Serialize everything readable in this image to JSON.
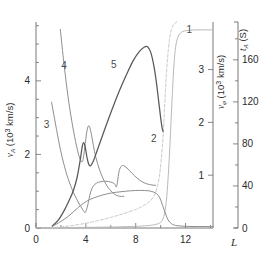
{
  "chart_data": {
    "type": "line",
    "title": "",
    "xlabel": "L",
    "ylabel": "v_A (10^3 km/s)",
    "ylabel_right_inner": "v_phi (10^3 km/s)",
    "ylabel_right_outer": "t_A (S)",
    "xlim": [
      0,
      14.2
    ],
    "ylim": [
      0,
      5.6
    ],
    "ylim_right_inner": [
      0,
      3.9
    ],
    "ylim_right_outer": [
      0,
      196
    ],
    "grid": false,
    "legend": "inline-curve-numbers",
    "xticks": [
      0,
      4,
      8,
      12
    ],
    "xticklabels": [
      "0",
      "4",
      "8",
      "12"
    ],
    "xminorticks": [
      2,
      6,
      10,
      14
    ],
    "yticks_left": [
      0,
      2,
      4
    ],
    "yticklabels_left": [
      "0",
      "2",
      "4"
    ],
    "yminorticks_left": [
      0.5,
      1,
      1.5,
      2.5,
      3,
      3.5,
      4.5,
      5,
      5.5
    ],
    "yticks_right_inner": [
      1,
      2,
      3
    ],
    "yticklabels_right_inner": [
      "1",
      "2",
      "3"
    ],
    "yticks_right_outer": [
      0,
      40,
      80,
      120,
      160
    ],
    "yticklabels_right_outer": [
      "0",
      "40",
      "80",
      "120",
      "160"
    ],
    "yminorticks_right_outer": [
      20,
      60,
      100,
      140,
      180
    ],
    "series": [
      {
        "name": "1",
        "label": "1",
        "axis": "right_outer",
        "color": "#b9b9b9",
        "style": "solid",
        "label_pos": {
          "x": 12.3,
          "y": 186
        },
        "points": [
          [
            0.0,
            0.3
          ],
          [
            2.0,
            0.4
          ],
          [
            4.0,
            0.6
          ],
          [
            6.0,
            0.9
          ],
          [
            8.0,
            1.6
          ],
          [
            9.0,
            2.3
          ],
          [
            9.6,
            3.4
          ],
          [
            10.0,
            5.5
          ],
          [
            10.25,
            11.0
          ],
          [
            10.45,
            25.0
          ],
          [
            10.6,
            48.0
          ],
          [
            10.75,
            80.0
          ],
          [
            10.9,
            118.0
          ],
          [
            11.05,
            152.0
          ],
          [
            11.2,
            172.0
          ],
          [
            11.4,
            182.0
          ],
          [
            11.7,
            186.5
          ],
          [
            12.2,
            188.0
          ],
          [
            13.0,
            188.5
          ],
          [
            14.2,
            188.5
          ]
        ]
      },
      {
        "name": "2",
        "label": "2",
        "axis": "right_inner",
        "color": "#c7c7c7",
        "style": "dashed",
        "label_pos": {
          "x": 9.45,
          "y": 1.62
        },
        "points": [
          [
            1.2,
            0.005
          ],
          [
            2.0,
            0.02
          ],
          [
            3.0,
            0.05
          ],
          [
            4.0,
            0.09
          ],
          [
            5.0,
            0.14
          ],
          [
            6.0,
            0.2
          ],
          [
            7.0,
            0.27
          ],
          [
            8.0,
            0.35
          ],
          [
            8.6,
            0.42
          ],
          [
            9.1,
            0.5
          ],
          [
            9.45,
            0.6
          ],
          [
            9.7,
            0.75
          ],
          [
            9.9,
            0.98
          ],
          [
            10.05,
            1.3
          ],
          [
            10.2,
            1.75
          ],
          [
            10.3,
            2.2
          ],
          [
            10.42,
            2.75
          ],
          [
            10.55,
            3.2
          ],
          [
            10.7,
            3.55
          ],
          [
            10.85,
            3.75
          ],
          [
            11.05,
            3.85
          ],
          [
            11.3,
            3.9
          ]
        ]
      },
      {
        "name": "3",
        "label": "3",
        "axis": "left",
        "color": "#8e8e8e",
        "style": "solid",
        "label_pos": {
          "x": 0.85,
          "y": 2.72
        },
        "points": [
          [
            1.25,
            3.42
          ],
          [
            1.5,
            2.95
          ],
          [
            1.8,
            2.4
          ],
          [
            2.1,
            1.92
          ],
          [
            2.5,
            1.42
          ],
          [
            2.9,
            1.05
          ],
          [
            3.3,
            0.76
          ],
          [
            3.6,
            0.58
          ],
          [
            3.8,
            0.47
          ],
          [
            3.95,
            0.42
          ],
          [
            4.1,
            0.55
          ],
          [
            4.25,
            0.78
          ],
          [
            4.4,
            1.0
          ],
          [
            4.6,
            1.14
          ],
          [
            4.85,
            1.22
          ],
          [
            5.2,
            1.26
          ],
          [
            5.6,
            1.27
          ],
          [
            6.0,
            1.25
          ],
          [
            6.3,
            1.2
          ],
          [
            6.45,
            1.12
          ],
          [
            6.55,
            1.28
          ],
          [
            6.65,
            1.52
          ],
          [
            6.8,
            1.66
          ],
          [
            7.0,
            1.7
          ],
          [
            7.3,
            1.63
          ],
          [
            7.7,
            1.49
          ],
          [
            8.1,
            1.36
          ],
          [
            8.5,
            1.26
          ],
          [
            8.9,
            1.2
          ],
          [
            9.3,
            1.17
          ],
          [
            9.6,
            1.16
          ]
        ]
      },
      {
        "name": "4",
        "label": "4",
        "axis": "left",
        "color": "#8e8e8e",
        "style": "solid",
        "label_pos": {
          "x": 2.25,
          "y": 4.32
        },
        "points": [
          [
            1.95,
            5.4
          ],
          [
            2.2,
            4.6
          ],
          [
            2.5,
            3.75
          ],
          [
            2.8,
            3.05
          ],
          [
            3.1,
            2.48
          ],
          [
            3.4,
            2.02
          ],
          [
            3.65,
            1.8
          ],
          [
            3.8,
            1.9
          ],
          [
            3.95,
            2.3
          ],
          [
            4.1,
            2.66
          ],
          [
            4.25,
            2.78
          ],
          [
            4.4,
            2.62
          ],
          [
            4.6,
            2.25
          ],
          [
            4.8,
            1.92
          ],
          [
            5.1,
            1.58
          ],
          [
            5.5,
            1.26
          ],
          [
            5.9,
            1.05
          ],
          [
            6.3,
            0.92
          ],
          [
            6.6,
            0.87
          ],
          [
            6.85,
            0.86
          ],
          [
            7.05,
            0.86
          ]
        ]
      },
      {
        "name": "5",
        "label": "5",
        "axis": "left",
        "color": "#585858",
        "style": "solid",
        "label_pos": {
          "x": 6.25,
          "y": 4.35
        },
        "points": [
          [
            1.3,
            0.05
          ],
          [
            1.8,
            0.22
          ],
          [
            2.3,
            0.5
          ],
          [
            2.7,
            0.78
          ],
          [
            3.0,
            1.02
          ],
          [
            3.3,
            1.38
          ],
          [
            3.55,
            1.85
          ],
          [
            3.7,
            2.2
          ],
          [
            3.82,
            2.32
          ],
          [
            3.95,
            2.2
          ],
          [
            4.1,
            1.9
          ],
          [
            4.25,
            1.72
          ],
          [
            4.4,
            1.7
          ],
          [
            4.6,
            1.82
          ],
          [
            4.9,
            2.1
          ],
          [
            5.3,
            2.48
          ],
          [
            5.8,
            2.95
          ],
          [
            6.3,
            3.4
          ],
          [
            6.8,
            3.82
          ],
          [
            7.3,
            4.2
          ],
          [
            7.8,
            4.55
          ],
          [
            8.3,
            4.8
          ],
          [
            8.7,
            4.92
          ],
          [
            8.95,
            4.93
          ],
          [
            9.2,
            4.78
          ],
          [
            9.45,
            4.42
          ],
          [
            9.65,
            3.98
          ],
          [
            9.85,
            3.42
          ],
          [
            10.0,
            3.0
          ],
          [
            10.12,
            2.72
          ],
          [
            10.2,
            2.62
          ]
        ]
      },
      {
        "name": "6",
        "label": "",
        "axis": "left",
        "color": "#8e8e8e",
        "style": "solid",
        "label_pos": null,
        "points": [
          [
            1.3,
            0.04
          ],
          [
            2.0,
            0.18
          ],
          [
            2.6,
            0.32
          ],
          [
            3.0,
            0.44
          ],
          [
            3.4,
            0.56
          ],
          [
            3.8,
            0.67
          ],
          [
            4.3,
            0.77
          ],
          [
            4.9,
            0.85
          ],
          [
            5.6,
            0.92
          ],
          [
            6.4,
            0.97
          ],
          [
            7.2,
            1.0
          ],
          [
            8.0,
            1.02
          ],
          [
            8.7,
            1.02
          ],
          [
            9.2,
            1.0
          ],
          [
            9.6,
            0.95
          ],
          [
            9.9,
            0.84
          ],
          [
            10.15,
            0.62
          ],
          [
            10.4,
            0.38
          ],
          [
            10.6,
            0.22
          ],
          [
            10.85,
            0.12
          ],
          [
            11.2,
            0.07
          ],
          [
            11.8,
            0.05
          ],
          [
            12.6,
            0.04
          ],
          [
            13.5,
            0.04
          ],
          [
            14.2,
            0.04
          ]
        ]
      }
    ],
    "annotations": [
      {
        "text": "1",
        "x": 12.3,
        "y": 186,
        "axis": "right_outer"
      },
      {
        "text": "2",
        "x": 9.45,
        "y": 1.62,
        "axis": "right_inner"
      },
      {
        "text": "3",
        "x": 0.85,
        "y": 2.72,
        "axis": "left"
      },
      {
        "text": "4",
        "x": 2.25,
        "y": 4.32,
        "axis": "left"
      },
      {
        "text": "5",
        "x": 6.25,
        "y": 4.35,
        "axis": "left"
      }
    ]
  },
  "axes": {
    "left": {
      "title_symbol": "v",
      "title_sub": "A",
      "title_unit": " (10",
      "title_exp": "3",
      "title_unit2": " km/s)",
      "ticklabels": [
        "0",
        "2",
        "4"
      ]
    },
    "right_inner": {
      "title_symbol": "v",
      "title_sub": "φ",
      "title_unit": " (10",
      "title_exp": "3",
      "title_unit2": " km/s)",
      "ticklabels": [
        "1",
        "2",
        "3"
      ]
    },
    "right_outer": {
      "title_symbol": "t",
      "title_sub": "A",
      "title_unit": " (S)",
      "ticklabels": [
        "0",
        "40",
        "80",
        "120",
        "160"
      ]
    },
    "bottom": {
      "title": "L",
      "ticklabels": [
        "0",
        "4",
        "8",
        "12"
      ]
    }
  },
  "colors": {
    "background": "#ffffff",
    "axis": "#6a6a6a",
    "text": "#2b2b2b",
    "curve_dark": "#585858",
    "curve_mid": "#8e8e8e",
    "curve_light": "#c7c7c7",
    "curve_pale": "#b9b9b9"
  }
}
